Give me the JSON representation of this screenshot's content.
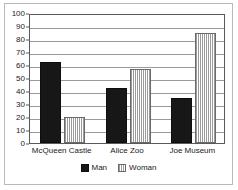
{
  "chart_data": {
    "type": "bar",
    "title": "",
    "xlabel": "",
    "ylabel": "",
    "categories": [
      "McQueen Castle",
      "Alice Zoo",
      "Joe Museum"
    ],
    "series": [
      {
        "name": "Man",
        "values": [
          62,
          42,
          35
        ],
        "color": "#171717",
        "pattern": "solid"
      },
      {
        "name": "Woman",
        "values": [
          20,
          57,
          85
        ],
        "color": "#ffffff",
        "pattern": "vertical-hatch"
      }
    ],
    "ylim": [
      0,
      100
    ],
    "ytick_step": 10,
    "yticks": [
      0,
      10,
      20,
      30,
      40,
      50,
      60,
      70,
      80,
      90,
      100
    ],
    "ytick_labels": [
      "0",
      "10",
      "20",
      "30",
      "40",
      "50",
      "60",
      "70",
      "80",
      "90",
      "100"
    ],
    "grid": true,
    "grid_axis": "y",
    "legend": true,
    "legend_position": "bottom-center",
    "legend_entries": [
      "Man",
      "Woman"
    ],
    "frame_color": "#b9b9b9",
    "axis_color": "#5a5a5a",
    "gridline_color": "#9a9a9a",
    "background": "#ffffff"
  }
}
